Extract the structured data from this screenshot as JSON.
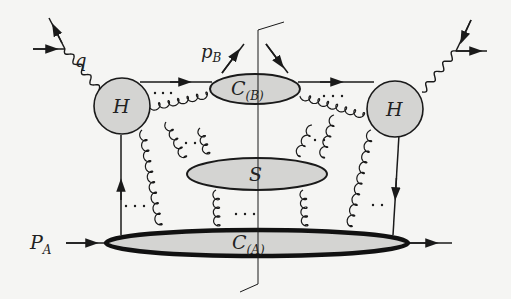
{
  "diagram": {
    "type": "feynman-factorization-diagram",
    "colors": {
      "line": "#1a1a1a",
      "blob_fill": "#d4d4d2",
      "background": "#f5f5f3"
    },
    "labels": {
      "photon": "q",
      "outgoing_hadron_B": "p",
      "outgoing_hadron_B_sub": "B",
      "hard_left": "H",
      "hard_right": "H",
      "jet_B": "C",
      "jet_B_sub": "(B)",
      "soft": "S",
      "incoming_hadron_A": "P",
      "incoming_hadron_A_sub": "A",
      "jet_A": "C",
      "jet_A_sub": "(A)",
      "ellipsis": "· · ·"
    },
    "nodes": [
      {
        "id": "H-left",
        "label": "H",
        "shape": "circle"
      },
      {
        "id": "H-right",
        "label": "H",
        "shape": "circle"
      },
      {
        "id": "C_B",
        "label": "C_(B)",
        "shape": "ellipse"
      },
      {
        "id": "S",
        "label": "S",
        "shape": "ellipse"
      },
      {
        "id": "C_A",
        "label": "C_(A)",
        "shape": "ellipse"
      }
    ],
    "edges": [
      {
        "from": "photon-in-left",
        "to": "H-left",
        "kind": "wavy",
        "label": "q"
      },
      {
        "from": "H-left",
        "to": "C_B",
        "kind": "fermion"
      },
      {
        "from": "C_B",
        "to": "H-right",
        "kind": "fermion"
      },
      {
        "from": "H-left",
        "to": "C_B",
        "kind": "gluon"
      },
      {
        "from": "C_B",
        "to": "H-right",
        "kind": "gluon"
      },
      {
        "from": "H-right",
        "to": "photon-out-right",
        "kind": "wavy"
      },
      {
        "from": "C_A",
        "to": "H-left",
        "kind": "fermion"
      },
      {
        "from": "H-right",
        "to": "C_A",
        "kind": "fermion"
      },
      {
        "from": "C_A",
        "to": "S",
        "kind": "gluon"
      },
      {
        "from": "S",
        "to": "C_B",
        "kind": "gluon"
      },
      {
        "from": "H-left",
        "to": "C_A",
        "kind": "gluon"
      },
      {
        "from": "H-right",
        "to": "C_A",
        "kind": "gluon"
      }
    ],
    "final_state_cut": true
  }
}
